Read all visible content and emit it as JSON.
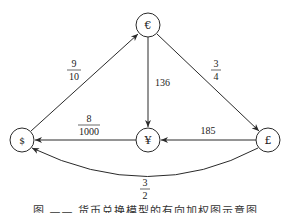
{
  "diagram": {
    "type": "directed-weighted-graph",
    "nodes": [
      {
        "id": "EUR",
        "label": "€",
        "x": 148,
        "y": 25
      },
      {
        "id": "USD",
        "label": "$",
        "x": 22,
        "y": 140
      },
      {
        "id": "JPY",
        "label": "¥",
        "x": 148,
        "y": 140
      },
      {
        "id": "GBP",
        "label": "£",
        "x": 268,
        "y": 140
      }
    ],
    "edges": [
      {
        "from": "USD",
        "to": "EUR",
        "weight": "9/10",
        "num": "9",
        "den": "10"
      },
      {
        "from": "EUR",
        "to": "JPY",
        "weight": "136"
      },
      {
        "from": "EUR",
        "to": "GBP",
        "weight": "3/4",
        "num": "3",
        "den": "4"
      },
      {
        "from": "JPY",
        "to": "USD",
        "weight": "8/1000",
        "num": "8",
        "den": "1000"
      },
      {
        "from": "GBP",
        "to": "JPY",
        "weight": "185"
      },
      {
        "from": "GBP",
        "to": "USD",
        "weight": "3/2",
        "num": "3",
        "den": "2"
      }
    ],
    "node_labels": {
      "eur": "€",
      "usd": "$",
      "jpy": "¥",
      "gbp": "£"
    },
    "edge_labels": {
      "usd_eur_num": "9",
      "usd_eur_den": "10",
      "eur_jpy": "136",
      "eur_gbp_num": "3",
      "eur_gbp_den": "4",
      "jpy_usd_num": "8",
      "jpy_usd_den": "1000",
      "gbp_jpy": "185",
      "gbp_usd_num": "3",
      "gbp_usd_den": "2"
    },
    "colors": {
      "stroke": "#2a2a2a",
      "background": "#ffffff"
    }
  },
  "caption": "图 —— 货币兑换模型的有向加权图示意图"
}
